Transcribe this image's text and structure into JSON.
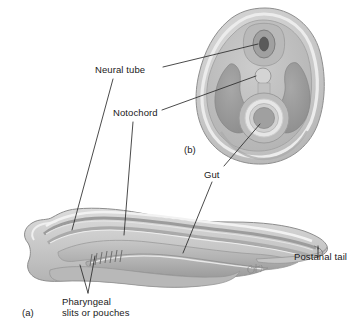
{
  "figure": {
    "panels": [
      {
        "tag": "(a)",
        "name": "lateral-view"
      },
      {
        "tag": "(b)",
        "name": "cross-section"
      }
    ]
  },
  "labels": {
    "neural_tube": "Neural tube",
    "notochord": "Notochord",
    "gut": "Gut",
    "postanal_tail": "Postanal tail",
    "pharyngeal_line1": "Pharyngeal",
    "pharyngeal_line2": "slits or pouches"
  },
  "panel_tags": {
    "a": "(a)",
    "b": "(b)"
  },
  "colors": {
    "background": "#ffffff",
    "text": "#1a1a1a",
    "leader_line": "#2b2b2b",
    "outline": "#8a8a8a",
    "body_light": "#d2d2d2",
    "body_mid": "#bdbdbd",
    "body_dark": "#a3a3a3",
    "body_darker": "#8f8f8f",
    "highlight": "#e8e8e8",
    "neural_tube_fill": "#9a9a9a",
    "neural_tube_lumen": "#5c5c5c",
    "notochord_fill": "#cfcfcf",
    "gut_ring": "#e4e4e4",
    "gut_lumen": "#9d9d9d"
  },
  "signature": {
    "present": true,
    "name": "artist-signature"
  }
}
